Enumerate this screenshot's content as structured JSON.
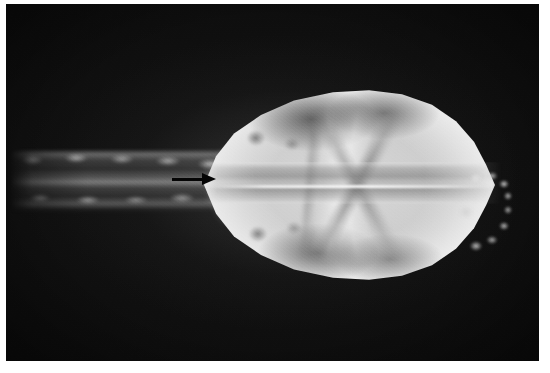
{
  "image": {
    "kind": "radiograph",
    "modality": "x-ray",
    "view": "dorsoventral",
    "subject": "small-animal-skull",
    "caption": "",
    "width": 550,
    "height": 373
  },
  "border": {
    "color": "#ffffff",
    "top": 4,
    "left": 6,
    "right": 11,
    "bottom": 12
  },
  "film": {
    "background_color": "#0b0b0b",
    "fog_color": "#151515",
    "bone_bright": "#ececec",
    "bone_mid": "#c2c2c2",
    "soft_tissue": "#808080",
    "grain": "heavy",
    "vignette": "true"
  },
  "anatomy": {
    "skull": {
      "label": "cranium",
      "description": "bright ovoid cranial vault, broad caudally and tapering rostrally"
    },
    "midline": {
      "label": "nasal-septum-midline",
      "description": "bright hairline running the long axis of the skull"
    },
    "midband": {
      "label": "nasal-palatal-band",
      "description": "mid-gray horizontal band through the skull centre"
    },
    "arches": {
      "label": "zygomatic-arches",
      "description": "paired bright diagonal struts converging rostrally"
    },
    "orbits": {
      "label": "orbits-and-bullae",
      "description": "paired dark rings with bright centres"
    },
    "sutures": {
      "label": "cranial-sutures",
      "description": "dark streaks crossing the vault"
    },
    "occiput": {
      "label": "occipital-region",
      "description": "caudal tip where skull meets the vertebral column"
    },
    "spine": {
      "label": "cervical-vertebral-column",
      "description": "segmented column of vertebral bodies extending to the left"
    },
    "teeth": {
      "label": "incisors-and-cheek-teeth",
      "description": "cluster of small dense opacities at the rostral end"
    }
  },
  "annotations": {
    "arrow": {
      "label": "annotation-arrow",
      "direction": "right",
      "color": "#050505",
      "points_at": "cervical-vertebral-column"
    }
  }
}
